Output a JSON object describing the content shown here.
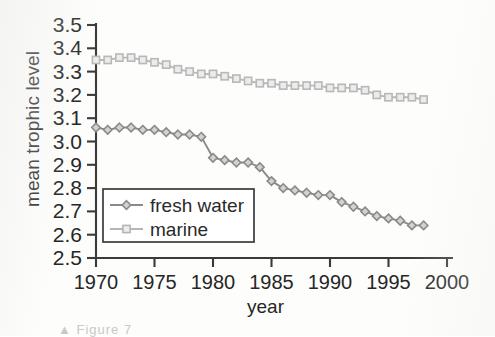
{
  "figure": {
    "ylabel": "mean trophic level",
    "xlabel": "year",
    "caption_fragment": "▲ Figure 7"
  },
  "axis": {
    "y_ticks": [
      "3.5",
      "3.4",
      "3.3",
      "3.2",
      "3.1",
      "3.0",
      "2.9",
      "2.8",
      "2.7",
      "2.6",
      "2.5"
    ],
    "x_ticks": [
      "1970",
      "1975",
      "1980",
      "1985",
      "1990",
      "1995",
      "2000"
    ]
  },
  "legend": {
    "items": [
      {
        "label": "fresh water",
        "marker": "diamond",
        "color": "#8a8a8a"
      },
      {
        "label": "marine",
        "marker": "square",
        "color": "#b5b5b5"
      }
    ]
  },
  "colors": {
    "fresh_water": "#8a8a8a",
    "marine": "#b8b8b8",
    "axis": "#3a3a3a",
    "background": "#fdfdfc"
  },
  "chart_data": {
    "type": "line",
    "title": "",
    "xlabel": "year",
    "ylabel": "mean trophic level",
    "xlim": [
      1970,
      2000
    ],
    "ylim": [
      2.5,
      3.5
    ],
    "grid": false,
    "legend_position": "lower-left-inside",
    "x": [
      1970,
      1971,
      1972,
      1973,
      1974,
      1975,
      1976,
      1977,
      1978,
      1979,
      1980,
      1981,
      1982,
      1983,
      1984,
      1985,
      1986,
      1987,
      1988,
      1989,
      1990,
      1991,
      1992,
      1993,
      1994,
      1995,
      1996,
      1997,
      1998
    ],
    "series": [
      {
        "name": "fresh water",
        "marker": "diamond",
        "color": "#8a8a8a",
        "values": [
          3.06,
          3.05,
          3.06,
          3.06,
          3.05,
          3.05,
          3.04,
          3.03,
          3.03,
          3.02,
          2.93,
          2.92,
          2.91,
          2.91,
          2.89,
          2.83,
          2.8,
          2.79,
          2.78,
          2.77,
          2.77,
          2.74,
          2.72,
          2.7,
          2.68,
          2.67,
          2.66,
          2.64,
          2.64
        ]
      },
      {
        "name": "marine",
        "marker": "square",
        "color": "#b8b8b8",
        "values": [
          3.35,
          3.35,
          3.36,
          3.36,
          3.35,
          3.34,
          3.33,
          3.31,
          3.3,
          3.29,
          3.29,
          3.28,
          3.27,
          3.26,
          3.25,
          3.25,
          3.24,
          3.24,
          3.24,
          3.24,
          3.23,
          3.23,
          3.23,
          3.22,
          3.2,
          3.19,
          3.19,
          3.19,
          3.18
        ]
      }
    ]
  }
}
